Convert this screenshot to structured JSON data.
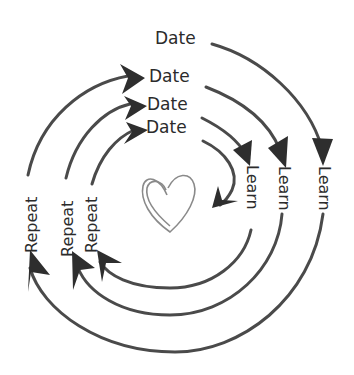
{
  "diagram": {
    "type": "cycle",
    "center_icon": "heart-icon",
    "rings": [
      {
        "name": "outer",
        "date": "Date",
        "learn": "Learn",
        "repeat": "Repeat"
      },
      {
        "name": "second",
        "date": "Date",
        "learn": "Learn",
        "repeat": "Repeat"
      },
      {
        "name": "third",
        "date": "Date",
        "learn": "Learn",
        "repeat": "Repeat"
      },
      {
        "name": "inner",
        "date": "Date"
      }
    ],
    "colors": {
      "stroke": "#4a4a4a",
      "text": "#2b2b2b",
      "heart": "#8a8a8a",
      "background": "#ffffff"
    }
  }
}
